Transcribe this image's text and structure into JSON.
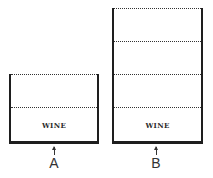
{
  "diagram": {
    "containers": [
      {
        "id": "A",
        "label": "A",
        "content_label": "WINE",
        "levels": 2,
        "filled_levels": 1
      },
      {
        "id": "B",
        "label": "B",
        "content_label": "WINE",
        "levels": 4,
        "filled_levels": 1
      }
    ],
    "colors": {
      "stroke": "#1e1e1e",
      "background": "#ffffff"
    }
  }
}
